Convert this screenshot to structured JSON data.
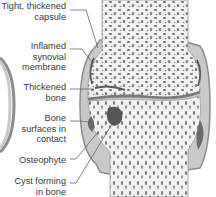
{
  "figure": {
    "labels": [
      {
        "id": "capsule",
        "text": "Tight, thickened\ncapsule",
        "top": 1
      },
      {
        "id": "synovial",
        "text": "Inflamed\nsynovial\nmembrane",
        "top": 41
      },
      {
        "id": "thickened-bone",
        "text": "Thickened\nbone",
        "top": 82
      },
      {
        "id": "bone-contact",
        "text": "Bone\nsurfaces in\ncontact",
        "top": 113
      },
      {
        "id": "osteophyte",
        "text": "Osteophyte",
        "top": 155
      },
      {
        "id": "cyst",
        "text": "Cyst forming\nin bone",
        "top": 176
      }
    ]
  },
  "colors": {
    "capsule": "#c9c9c9",
    "capsule_edge": "#8c8c8c",
    "bone": "#f2f2f2",
    "trabecular": "#6f6f6f",
    "leader_line": "#555555",
    "text": "#3a3a3a"
  }
}
